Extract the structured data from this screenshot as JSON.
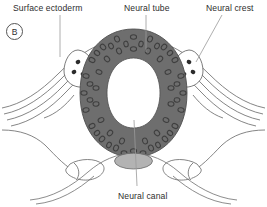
{
  "figure": {
    "panel_letter": "B",
    "caption_labels": {
      "surface_ectoderm": "Surface ectoderm",
      "neural_tube": "Neural tube",
      "neural_crest": "Neural crest",
      "neural_canal": "Neural canal"
    },
    "colors": {
      "neural_tube_fill": "#6e6e6e",
      "neural_tube_nucleus": "#4a4a4a",
      "lumen_fill": "#ffffff",
      "notochord_fill": "#b3b3b3",
      "outline": "#555555",
      "leader_line": "#8a8a8a",
      "background": "#ffffff",
      "text": "#2e2e2e"
    },
    "structures": [
      {
        "name": "neural-tube",
        "description": "dark grey oval ring of neuroepithelium with pseudostratified nuclei"
      },
      {
        "name": "neural-canal",
        "description": "white lumen inside the neural tube"
      },
      {
        "name": "neural-crest-left",
        "description": "teardrop cell cluster with 3 dark nuclei, left dorsolateral"
      },
      {
        "name": "neural-crest-right",
        "description": "teardrop cell cluster with 3 dark nuclei, right dorsolateral"
      },
      {
        "name": "surface-ectoderm",
        "description": "thin multi-line epithelial sheet fused over the dorsal midline"
      },
      {
        "name": "notochord",
        "description": "grey ellipse ventral to the neural tube"
      },
      {
        "name": "somite-left",
        "description": "outlined oval mesodermal block, lower left"
      },
      {
        "name": "somite-right",
        "description": "outlined oval mesodermal block, lower right"
      }
    ],
    "crest_nuclei_count": 3
  }
}
